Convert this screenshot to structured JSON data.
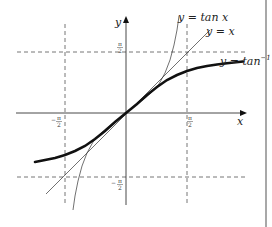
{
  "figure": {
    "axes": {
      "x_label": "x",
      "y_label": "y"
    },
    "ticks": {
      "x_neg": "−π/2",
      "x_pos": "π/2",
      "y_pos": "π/2",
      "y_neg": "−π/2",
      "num_pi": "π",
      "den_2": "2",
      "minus": "−"
    },
    "curves": [
      {
        "name": "tan",
        "label": "y = tan x"
      },
      {
        "name": "identity",
        "label": "y = x"
      },
      {
        "name": "arctan",
        "label_main": "y = tan",
        "label_sup": "−1",
        "label_var": " x"
      }
    ],
    "colors": {
      "axis": "#333333",
      "dashed": "#666666",
      "curve": "#222222",
      "border": "#a8a8a8"
    }
  }
}
